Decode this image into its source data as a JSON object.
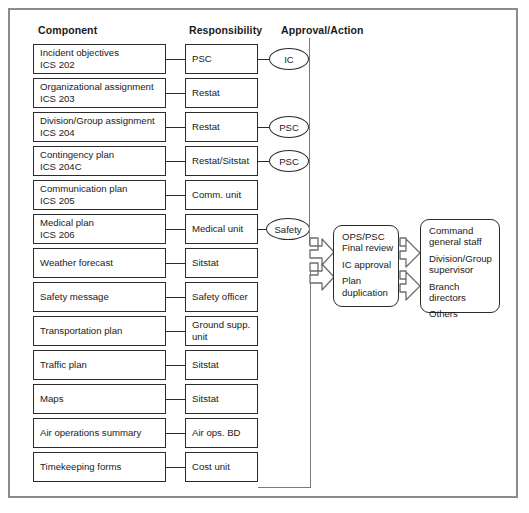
{
  "frame": {
    "border_color": "#8c8c8c"
  },
  "headers": {
    "component": "Component",
    "responsibility": "Responsibility",
    "approval": "Approval/Action"
  },
  "rows": [
    {
      "component_line1": "Incident objectives",
      "component_line2": "ICS 202",
      "responsibility": "PSC",
      "approval": "IC"
    },
    {
      "component_line1": "Organizational assignment",
      "component_line2": "ICS 203",
      "responsibility": "Restat",
      "approval": ""
    },
    {
      "component_line1": "Division/Group assignment",
      "component_line2": "ICS 204",
      "responsibility": "Restat",
      "approval": "PSC"
    },
    {
      "component_line1": "Contingency plan",
      "component_line2": "ICS 204C",
      "responsibility": "Restat/Sitstat",
      "approval": "PSC"
    },
    {
      "component_line1": "Communication plan",
      "component_line2": "ICS 205",
      "responsibility": "Comm. unit",
      "approval": ""
    },
    {
      "component_line1": "Medical plan",
      "component_line2": "ICS 206",
      "responsibility": "Medical unit",
      "approval": "Safety"
    },
    {
      "component_line1": "Weather forecast",
      "component_line2": "",
      "responsibility": "Sitstat",
      "approval": ""
    },
    {
      "component_line1": "Safety message",
      "component_line2": "",
      "responsibility": "Safety officer",
      "approval": ""
    },
    {
      "component_line1": "Transportation plan",
      "component_line2": "",
      "responsibility": "Ground supp.",
      "responsibility_line2": "unit",
      "approval": ""
    },
    {
      "component_line1": "Traffic plan",
      "component_line2": "",
      "responsibility": "Sitstat",
      "approval": ""
    },
    {
      "component_line1": "Maps",
      "component_line2": "",
      "responsibility": "Sitstat",
      "approval": ""
    },
    {
      "component_line1": "Air operations summary",
      "component_line2": "",
      "responsibility": "Air ops. BD",
      "approval": ""
    },
    {
      "component_line1": "Timekeeping forms",
      "component_line2": "",
      "responsibility": "Cost unit",
      "approval": ""
    }
  ],
  "review_box": {
    "line1": "OPS/PSC",
    "line2": "Final review",
    "line3": "IC approval",
    "line4": "Plan",
    "line5": "duplication"
  },
  "distribution_box": {
    "line1": "Command",
    "line2": "general staff",
    "line3": "Division/Group",
    "line4": "supervisor",
    "line5": "Branch",
    "line6": "directors",
    "line7": "Others"
  }
}
